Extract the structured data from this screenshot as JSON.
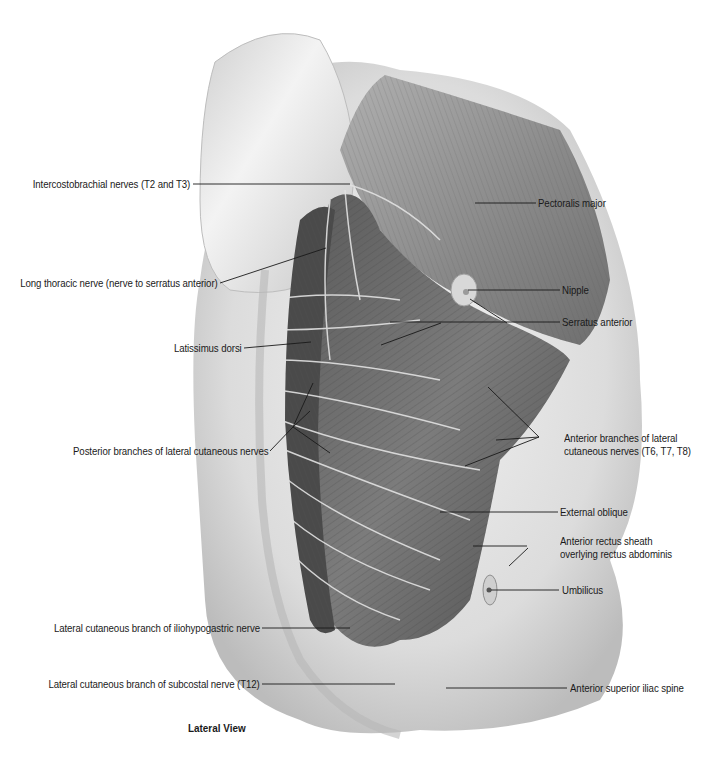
{
  "figure": {
    "view_caption": "Lateral View",
    "labels_left": [
      {
        "id": "intercostobrachial",
        "text": "Intercostobrachial nerves (T2 and T3)"
      },
      {
        "id": "long-thoracic",
        "text": "Long thoracic nerve (nerve to serratus anterior)"
      },
      {
        "id": "latissimus",
        "text": "Latissimus dorsi"
      },
      {
        "id": "posterior-branches",
        "text": "Posterior branches of lateral cutaneous nerves"
      },
      {
        "id": "iliohypogastric",
        "text": "Lateral cutaneous branch of iliohypogastric nerve"
      },
      {
        "id": "subcostal",
        "text": "Lateral cutaneous branch of subcostal nerve (T12)"
      }
    ],
    "labels_right": [
      {
        "id": "pectoralis",
        "text": "Pectoralis major"
      },
      {
        "id": "nipple",
        "text": "Nipple"
      },
      {
        "id": "serratus",
        "text": "Serratus anterior"
      },
      {
        "id": "anterior-branches",
        "line1": "Anterior branches of lateral",
        "line2": "cutaneous nerves (T6, T7, T8)"
      },
      {
        "id": "external-oblique",
        "text": "External oblique"
      },
      {
        "id": "rectus-sheath",
        "line1": "Anterior rectus sheath",
        "line2": "overlying rectus abdominis"
      },
      {
        "id": "umbilicus",
        "text": "Umbilicus"
      },
      {
        "id": "asis",
        "text": "Anterior superior iliac spine"
      }
    ]
  }
}
